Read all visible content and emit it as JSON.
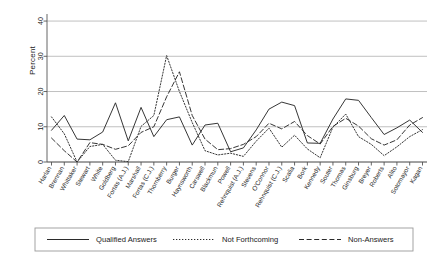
{
  "chart_data": {
    "type": "line",
    "title": "",
    "xlabel": "",
    "ylabel": "Percent",
    "ylim": [
      0,
      42
    ],
    "yticks": [
      0,
      10,
      20,
      30,
      40
    ],
    "grid": true,
    "legend_position": "bottom",
    "categories": [
      "Harlan",
      "Brennan",
      "Whittaker",
      "Stewart",
      "White",
      "Goldberg",
      "Fortas (A.J.)",
      "Marshall",
      "Fortas (C.J.)",
      "Thornberry",
      "Burger",
      "Haynsworth",
      "Carswell",
      "Blackmun",
      "Powell",
      "Rehnquist (A.J.)",
      "Stevens",
      "O'Connor",
      "Rehnquist (C.J.)",
      "Scalia",
      "Bork",
      "Kennedy",
      "Souter",
      "Thomas",
      "Ginsburg",
      "Breyer",
      "Roberts",
      "Alito",
      "Sotomayor",
      "Kagan"
    ],
    "series": [
      {
        "name": "Qualified Answers",
        "style": "solid",
        "values": [
          9.0,
          13.2,
          6.5,
          6.3,
          8.5,
          16.8,
          6.0,
          15.5,
          7.2,
          12.0,
          12.8,
          4.8,
          10.5,
          11.0,
          2.9,
          4.0,
          9.1,
          15.0,
          17.0,
          16.0,
          5.4,
          5.3,
          12.2,
          17.9,
          17.5,
          12.6,
          7.8,
          9.7,
          11.9,
          8.4
        ]
      },
      {
        "name": "Not Forthcoming",
        "style": "dotted",
        "values": [
          12.8,
          8.0,
          0.0,
          4.4,
          5.0,
          0.5,
          0.1,
          10.1,
          13.2,
          30.2,
          20.0,
          11.2,
          3.2,
          2.0,
          2.5,
          1.6,
          5.9,
          9.6,
          4.2,
          7.6,
          3.7,
          1.2,
          9.9,
          13.6,
          7.2,
          5.0,
          1.8,
          4.3,
          7.2,
          9.2
        ]
      },
      {
        "name": "Non-Answers",
        "style": "dashed",
        "values": [
          6.8,
          3.2,
          0.0,
          5.5,
          5.0,
          3.6,
          4.6,
          8.4,
          10.0,
          18.5,
          25.6,
          13.2,
          6.5,
          3.5,
          3.8,
          5.0,
          7.2,
          11.0,
          9.4,
          11.5,
          7.5,
          5.1,
          10.1,
          12.4,
          10.2,
          6.6,
          4.8,
          6.3,
          10.5,
          12.6
        ]
      }
    ]
  },
  "legend": {
    "entries": [
      {
        "label": "Qualified Answers",
        "style": "solid"
      },
      {
        "label": "Not Forthcoming",
        "style": "dotted"
      },
      {
        "label": "Non-Answers",
        "style": "dashed"
      }
    ]
  }
}
